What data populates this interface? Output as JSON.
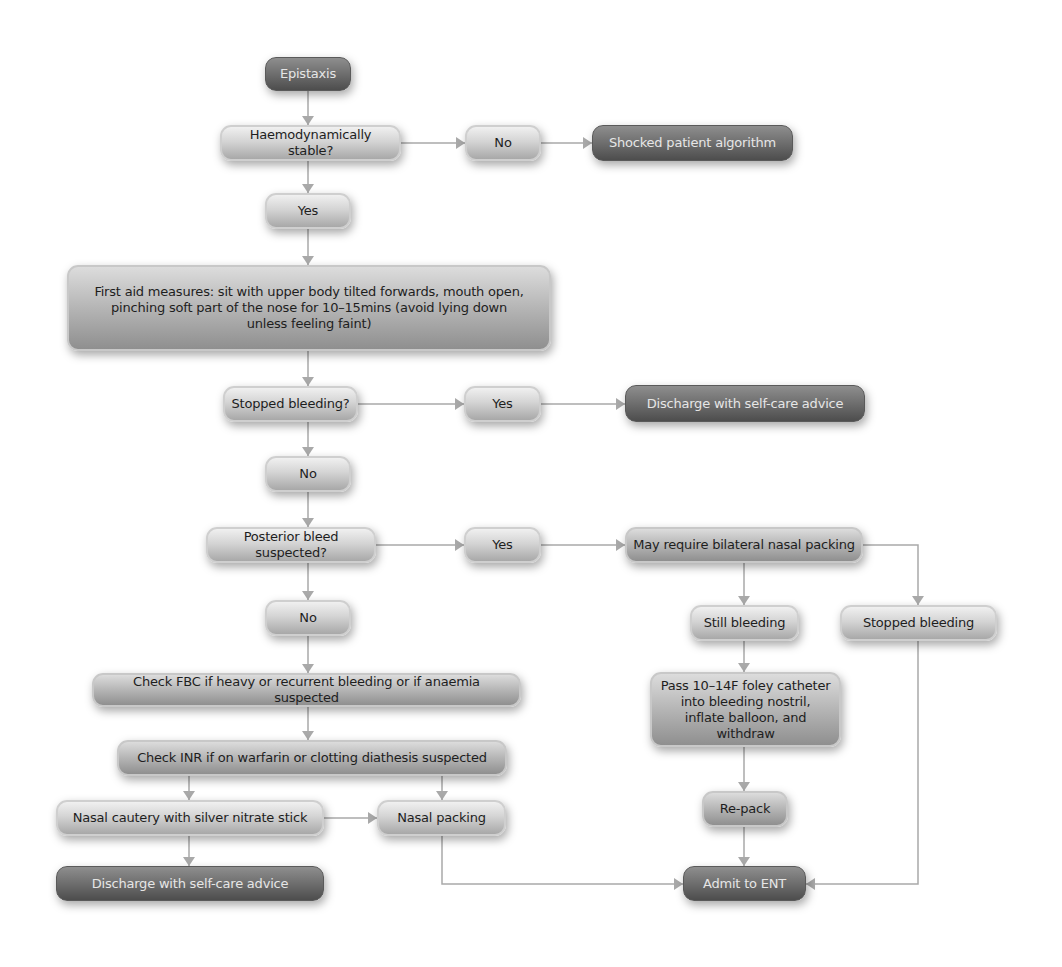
{
  "diagram": {
    "type": "flowchart",
    "title": "Epistaxis",
    "colors": {
      "terminal": "#6e6e6e",
      "process": "#d4d4d4",
      "connector": "#a9a9a9"
    },
    "nodes": {
      "epistaxis": "Epistaxis",
      "haemo_stable": "Haemodynamically stable?",
      "no_shock": "No",
      "shocked": "Shocked patient algorithm",
      "yes_stable": "Yes",
      "first_aid": "First aid measures: sit with upper body tilted forwards, mouth open, pinching soft part of the nose for 10–15mins (avoid lying down unless feeling faint)",
      "stopped_q": "Stopped bleeding?",
      "yes_stopped": "Yes",
      "discharge_1": "Discharge with self-care advice",
      "no_stopped": "No",
      "posterior_q": "Posterior bleed suspected?",
      "yes_posterior": "Yes",
      "bilateral": "May require bilateral nasal packing",
      "no_posterior": "No",
      "still_bleeding": "Still bleeding",
      "stopped_bleeding": "Stopped bleeding",
      "foley": "Pass 10–14F foley catheter into bleeding nostril, inflate balloon, and withdraw",
      "check_fbc": "Check FBC if heavy or recurrent bleeding or if anaemia suspected",
      "check_inr": "Check INR if on warfarin or clotting diathesis suspected",
      "cautery": "Nasal cautery with silver nitrate stick",
      "nasal_packing": "Nasal packing",
      "repack": "Re-pack",
      "discharge_2": "Discharge with self-care advice",
      "admit_ent": "Admit to ENT"
    },
    "edges": [
      [
        "epistaxis",
        "haemo_stable"
      ],
      [
        "haemo_stable",
        "no_shock"
      ],
      [
        "no_shock",
        "shocked"
      ],
      [
        "haemo_stable",
        "yes_stable"
      ],
      [
        "yes_stable",
        "first_aid"
      ],
      [
        "first_aid",
        "stopped_q"
      ],
      [
        "stopped_q",
        "yes_stopped"
      ],
      [
        "yes_stopped",
        "discharge_1"
      ],
      [
        "stopped_q",
        "no_stopped"
      ],
      [
        "no_stopped",
        "posterior_q"
      ],
      [
        "posterior_q",
        "yes_posterior"
      ],
      [
        "yes_posterior",
        "bilateral"
      ],
      [
        "bilateral",
        "still_bleeding"
      ],
      [
        "bilateral",
        "stopped_bleeding"
      ],
      [
        "still_bleeding",
        "foley"
      ],
      [
        "foley",
        "repack"
      ],
      [
        "repack",
        "admit_ent"
      ],
      [
        "stopped_bleeding",
        "admit_ent"
      ],
      [
        "posterior_q",
        "no_posterior"
      ],
      [
        "no_posterior",
        "check_fbc"
      ],
      [
        "check_fbc",
        "check_inr"
      ],
      [
        "check_inr",
        "cautery"
      ],
      [
        "check_inr",
        "nasal_packing"
      ],
      [
        "cautery",
        "nasal_packing"
      ],
      [
        "cautery",
        "discharge_2"
      ],
      [
        "nasal_packing",
        "admit_ent"
      ]
    ]
  }
}
